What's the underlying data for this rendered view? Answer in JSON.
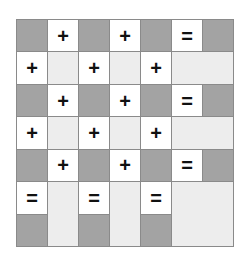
{
  "puzzle": {
    "rows": 7,
    "cols": 7,
    "colors": {
      "dark": "#a3a3a3",
      "white": "#ffffff",
      "light": "#ededed",
      "border": "#8a8a8a"
    },
    "cells": [
      {
        "r": 0,
        "c": 0,
        "type": "dark",
        "text": ""
      },
      {
        "r": 0,
        "c": 1,
        "type": "white",
        "text": "+"
      },
      {
        "r": 0,
        "c": 2,
        "type": "dark",
        "text": ""
      },
      {
        "r": 0,
        "c": 3,
        "type": "white",
        "text": "+"
      },
      {
        "r": 0,
        "c": 4,
        "type": "dark",
        "text": ""
      },
      {
        "r": 0,
        "c": 5,
        "type": "white",
        "text": "="
      },
      {
        "r": 0,
        "c": 6,
        "type": "dark",
        "text": ""
      },
      {
        "r": 1,
        "c": 0,
        "type": "white",
        "text": "+"
      },
      {
        "r": 1,
        "c": 1,
        "type": "light",
        "text": ""
      },
      {
        "r": 1,
        "c": 2,
        "type": "white",
        "text": "+"
      },
      {
        "r": 1,
        "c": 3,
        "type": "light",
        "text": ""
      },
      {
        "r": 1,
        "c": 4,
        "type": "white",
        "text": "+"
      },
      {
        "r": 1,
        "c": 5,
        "type": "light",
        "text": "",
        "colspan": 2
      },
      {
        "r": 2,
        "c": 0,
        "type": "dark",
        "text": ""
      },
      {
        "r": 2,
        "c": 1,
        "type": "white",
        "text": "+"
      },
      {
        "r": 2,
        "c": 2,
        "type": "dark",
        "text": ""
      },
      {
        "r": 2,
        "c": 3,
        "type": "white",
        "text": "+"
      },
      {
        "r": 2,
        "c": 4,
        "type": "dark",
        "text": ""
      },
      {
        "r": 2,
        "c": 5,
        "type": "white",
        "text": "="
      },
      {
        "r": 2,
        "c": 6,
        "type": "dark",
        "text": ""
      },
      {
        "r": 3,
        "c": 0,
        "type": "white",
        "text": "+"
      },
      {
        "r": 3,
        "c": 1,
        "type": "light",
        "text": ""
      },
      {
        "r": 3,
        "c": 2,
        "type": "white",
        "text": "+"
      },
      {
        "r": 3,
        "c": 3,
        "type": "light",
        "text": ""
      },
      {
        "r": 3,
        "c": 4,
        "type": "white",
        "text": "+"
      },
      {
        "r": 3,
        "c": 5,
        "type": "light",
        "text": "",
        "colspan": 2
      },
      {
        "r": 4,
        "c": 0,
        "type": "dark",
        "text": ""
      },
      {
        "r": 4,
        "c": 1,
        "type": "white",
        "text": "+"
      },
      {
        "r": 4,
        "c": 2,
        "type": "dark",
        "text": ""
      },
      {
        "r": 4,
        "c": 3,
        "type": "white",
        "text": "+"
      },
      {
        "r": 4,
        "c": 4,
        "type": "dark",
        "text": ""
      },
      {
        "r": 4,
        "c": 5,
        "type": "white",
        "text": "="
      },
      {
        "r": 4,
        "c": 6,
        "type": "dark",
        "text": ""
      },
      {
        "r": 5,
        "c": 0,
        "type": "white",
        "text": "="
      },
      {
        "r": 5,
        "c": 1,
        "type": "light",
        "text": "",
        "rowspan": 2
      },
      {
        "r": 5,
        "c": 2,
        "type": "white",
        "text": "="
      },
      {
        "r": 5,
        "c": 3,
        "type": "light",
        "text": "",
        "rowspan": 2
      },
      {
        "r": 5,
        "c": 4,
        "type": "white",
        "text": "="
      },
      {
        "r": 5,
        "c": 5,
        "type": "light",
        "text": "",
        "rowspan": 2,
        "colspan": 2
      },
      {
        "r": 6,
        "c": 0,
        "type": "dark",
        "text": ""
      },
      {
        "r": 6,
        "c": 2,
        "type": "dark",
        "text": ""
      },
      {
        "r": 6,
        "c": 4,
        "type": "dark",
        "text": ""
      }
    ]
  }
}
